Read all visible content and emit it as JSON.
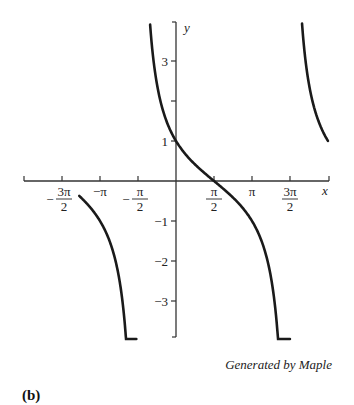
{
  "chart_data": {
    "type": "line",
    "title": "",
    "function": "y = cot(x/2 + π/4)",
    "xlabel": "x",
    "ylabel": "y",
    "xlim": [
      -4.71,
      6.28
    ],
    "ylim": [
      -3.9,
      4.0
    ],
    "x_ticks": [
      {
        "value": -4.712,
        "label_num": "3π",
        "label_den": "2",
        "sign": "−"
      },
      {
        "value": -3.1416,
        "label": "−π"
      },
      {
        "value": -1.5708,
        "label_num": "π",
        "label_den": "2",
        "sign": "−"
      },
      {
        "value": 1.5708,
        "label_num": "π",
        "label_den": "2",
        "sign": ""
      },
      {
        "value": 3.1416,
        "label": "π"
      },
      {
        "value": 4.712,
        "label_num": "3π",
        "label_den": "2",
        "sign": ""
      }
    ],
    "y_ticks": [
      {
        "value": 3,
        "label": "3"
      },
      {
        "value": 2,
        "label": ""
      },
      {
        "value": 1,
        "label": "1"
      },
      {
        "value": -1,
        "label": "−1"
      },
      {
        "value": -2,
        "label": "−2"
      },
      {
        "value": -3,
        "label": "−3"
      }
    ],
    "series": [
      {
        "name": "branch-1",
        "x_range": [
          -4.0,
          -1.64
        ],
        "description": "decreasing from y≈1 through zero at x=−3π/2 down toward −∞ near x=−π/2"
      },
      {
        "name": "branch-2",
        "x_range": [
          -1.07,
          4.71
        ],
        "description": "decreasing from y≈4 near asymptote x=−π/2, through (0,1), zero at x=π/2, to −∞ near x=3π/2"
      },
      {
        "name": "branch-3",
        "x_range": [
          5.21,
          6.28
        ],
        "description": "decreasing from y≈4 near asymptote x=3π/2 down to y=1 at x=2π"
      }
    ],
    "grid": false,
    "legend": null
  },
  "labels": {
    "x_axis": "x",
    "y_axis": "y",
    "credit": "Generated by Maple",
    "panel": "(b)"
  }
}
